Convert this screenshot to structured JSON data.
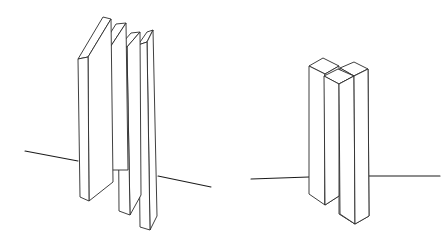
{
  "image": {
    "kind": "line-drawing",
    "description": "Two pencil sketches of vertical rectangular bars standing across a horizon line",
    "background_color": "#ffffff",
    "ink_color": "#2a2a2a"
  },
  "left_sketch": {
    "label": "four thin slabs leaning in perspective",
    "slab_count": 4
  },
  "right_sketch": {
    "label": "three square prisms clustered",
    "prism_count": 3
  }
}
